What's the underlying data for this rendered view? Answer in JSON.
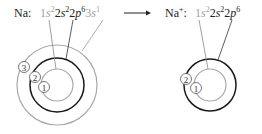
{
  "left": {
    "label": "Na:",
    "config": [
      {
        "orbital": "1",
        "letter": "s",
        "sup": "2",
        "color": "#999999"
      },
      {
        "orbital": "2",
        "letter": "s",
        "sup": "2",
        "color": "#222222"
      },
      {
        "orbital": "2",
        "letter": "p",
        "sup": "6",
        "color": "#222222"
      },
      {
        "orbital": "3",
        "letter": "s",
        "sup": "1",
        "color": "#999999"
      }
    ],
    "shell_labels": [
      "1",
      "2",
      "3"
    ]
  },
  "arrow": "→",
  "right": {
    "label": "Na",
    "charge": "+",
    "colon": ":",
    "config": [
      {
        "orbital": "1",
        "letter": "s",
        "sup": "2",
        "color": "#999999"
      },
      {
        "orbital": "2",
        "letter": "s",
        "sup": "2",
        "color": "#222222"
      },
      {
        "orbital": "2",
        "letter": "p",
        "sup": "6",
        "color": "#222222"
      }
    ],
    "shell_labels": [
      "1",
      "2"
    ]
  },
  "colors": {
    "gray": "#a0a0a0",
    "dark": "#1a1a1a",
    "text": "#222222"
  }
}
